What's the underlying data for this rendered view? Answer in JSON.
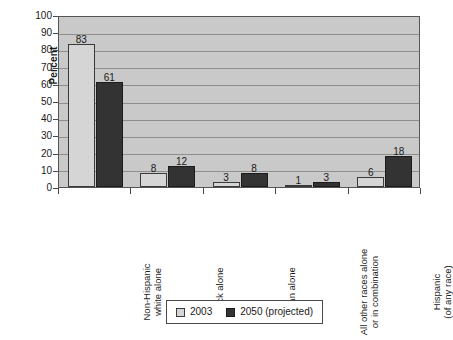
{
  "chart_data": {
    "type": "bar",
    "title": "",
    "xlabel": "",
    "ylabel": "Percent",
    "ylim": [
      0,
      100
    ],
    "ytick_step": 10,
    "yticks": [
      "100",
      "90",
      "80",
      "70",
      "60",
      "50",
      "40",
      "30",
      "20",
      "10",
      "0"
    ],
    "grid": true,
    "legend_position": "bottom",
    "categories": [
      "Non-Hispanic\nwhite alone",
      "Black alone",
      "Asian alone",
      "All other races alone\nor in combination",
      "Hispanic\n(of any race)"
    ],
    "series": [
      {
        "name": "2003",
        "color": "#d5d5d5",
        "values": [
          83,
          8,
          3,
          1,
          6
        ]
      },
      {
        "name": "2050 (projected)",
        "color": "#333333",
        "values": [
          61,
          12,
          8,
          3,
          18
        ]
      }
    ],
    "data_labels": [
      [
        "83",
        "61"
      ],
      [
        "8",
        "12"
      ],
      [
        "3",
        "8"
      ],
      [
        "1",
        "3"
      ],
      [
        "6",
        "18"
      ]
    ]
  },
  "legend": {
    "items": [
      {
        "label": "2003",
        "swatch": "light-gray-swatch"
      },
      {
        "label": "2050 (projected)",
        "swatch": "dark-gray-swatch"
      }
    ]
  }
}
